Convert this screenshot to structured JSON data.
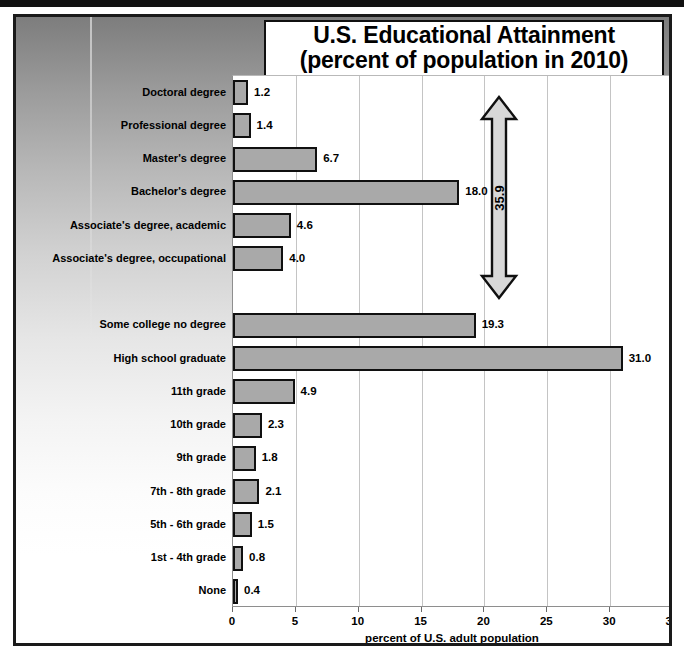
{
  "chart_data": {
    "type": "bar",
    "orientation": "horizontal",
    "title": "U.S. Educational Attainment",
    "subtitle": "(percent of population in 2010)",
    "xlabel": "percent of U.S. adult population",
    "ylabel": "",
    "xlim": [
      0,
      35
    ],
    "xticks": [
      "0",
      "5",
      "10",
      "15",
      "20",
      "25",
      "30",
      "35"
    ],
    "grid": true,
    "legend": "none",
    "bar_color": "#a9a9a9",
    "bar_edge_color": "#101010",
    "categories": [
      "Doctoral degree",
      "Professional degree",
      "Master's degree",
      "Bachelor's degree",
      "Associate's degree, academic",
      "Associate's degree, occupational",
      "",
      "Some college no degree",
      "High school graduate",
      "11th grade",
      "10th grade",
      "9th grade",
      "7th - 8th grade",
      "5th - 6th grade",
      "1st - 4th grade",
      "None"
    ],
    "values": [
      1.2,
      1.4,
      6.7,
      18.0,
      4.6,
      4.0,
      null,
      19.3,
      31.0,
      4.9,
      2.3,
      1.8,
      2.1,
      1.5,
      0.8,
      0.4
    ],
    "value_labels": [
      "1.2",
      "1.4",
      "6.7",
      "18.0",
      "4.6",
      "4.0",
      "",
      "19.3",
      "31.0",
      "4.9",
      "2.3",
      "1.8",
      "2.1",
      "1.5",
      "0.8",
      "0.4"
    ],
    "annotations": [
      {
        "name": "college-total-arrow",
        "label": "35.9",
        "kind": "double-headed-vertical-arrow",
        "spans_categories": [
          "Doctoral degree",
          "Associate's degree, occupational"
        ]
      }
    ]
  }
}
